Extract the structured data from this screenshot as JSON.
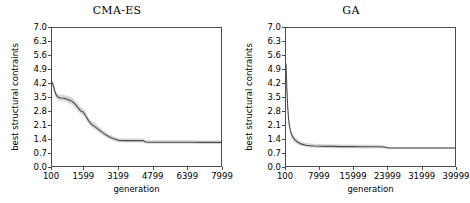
{
  "figure": {
    "width": 468,
    "height": 203,
    "background": "#ffffff",
    "line_color": "#4d4d4d",
    "band_color": "#c8c8c8",
    "axis_color": "#4c4c4c"
  },
  "panels": [
    {
      "id": "cma-es",
      "title": "CMA-ES",
      "xlabel": "generation",
      "ylabel": "best structural contraints"
    },
    {
      "id": "ga",
      "title": "GA",
      "xlabel": "generation",
      "ylabel": "best structural contraints"
    }
  ],
  "chart_data": [
    {
      "type": "line",
      "title": "CMA-ES",
      "xlabel": "generation",
      "ylabel": "best structural contraints",
      "xlim": [
        100,
        7999
      ],
      "ylim": [
        0.0,
        7.0
      ],
      "grid": false,
      "legend": null,
      "xticks": [
        100,
        1599,
        3199,
        4799,
        6399,
        7999
      ],
      "xticklabels": [
        "100",
        "1599",
        "3199",
        "4799",
        "6399",
        "7999"
      ],
      "yticks": [
        0.0,
        0.7,
        1.4,
        2.1,
        2.8,
        3.5,
        4.2,
        4.9,
        5.6,
        6.3,
        7.0
      ],
      "yticklabels": [
        "0.0",
        "0.7",
        "1.4",
        "2.1",
        "2.8",
        "3.5",
        "4.2",
        "4.9",
        "5.6",
        "6.3",
        "7.0"
      ],
      "series": [
        {
          "name": "best structural contraints (mean)",
          "x": [
            100,
            180,
            260,
            340,
            420,
            520,
            620,
            720,
            820,
            940,
            1060,
            1180,
            1300,
            1420,
            1540,
            1660,
            1780,
            1900,
            2020,
            2140,
            2260,
            2380,
            2500,
            2620,
            2740,
            2860,
            2980,
            3100,
            3199,
            3400,
            3700,
            4000,
            4300,
            4420,
            4600,
            5000,
            5500,
            6000,
            6500,
            7000,
            7500,
            7999
          ],
          "values": [
            4.3,
            4.05,
            3.72,
            3.58,
            3.52,
            3.5,
            3.49,
            3.47,
            3.42,
            3.38,
            3.3,
            3.18,
            3.02,
            2.86,
            2.8,
            2.6,
            2.38,
            2.2,
            2.12,
            2.02,
            1.92,
            1.82,
            1.72,
            1.64,
            1.56,
            1.5,
            1.45,
            1.41,
            1.38,
            1.37,
            1.37,
            1.37,
            1.37,
            1.3,
            1.29,
            1.29,
            1.29,
            1.29,
            1.29,
            1.28,
            1.28,
            1.28
          ],
          "band_lower": [
            4.2,
            3.92,
            3.58,
            3.44,
            3.38,
            3.36,
            3.34,
            3.32,
            3.26,
            3.2,
            3.12,
            3.0,
            2.84,
            2.7,
            2.62,
            2.44,
            2.24,
            2.06,
            1.98,
            1.88,
            1.78,
            1.7,
            1.6,
            1.52,
            1.46,
            1.4,
            1.35,
            1.31,
            1.29,
            1.28,
            1.28,
            1.28,
            1.28,
            1.22,
            1.21,
            1.21,
            1.21,
            1.21,
            1.21,
            1.2,
            1.2,
            1.2
          ],
          "band_upper": [
            4.4,
            4.2,
            3.88,
            3.74,
            3.68,
            3.66,
            3.66,
            3.64,
            3.6,
            3.58,
            3.5,
            3.38,
            3.22,
            3.04,
            2.98,
            2.78,
            2.54,
            2.36,
            2.28,
            2.18,
            2.08,
            1.96,
            1.86,
            1.78,
            1.68,
            1.62,
            1.56,
            1.52,
            1.49,
            1.48,
            1.48,
            1.48,
            1.48,
            1.4,
            1.39,
            1.39,
            1.39,
            1.39,
            1.39,
            1.38,
            1.38,
            1.38
          ]
        }
      ]
    },
    {
      "type": "line",
      "title": "GA",
      "xlabel": "generation",
      "ylabel": "best structural contraints",
      "xlim": [
        100,
        39999
      ],
      "ylim": [
        0.0,
        7.0
      ],
      "grid": false,
      "legend": null,
      "xticks": [
        100,
        7999,
        15999,
        23999,
        31999,
        39999
      ],
      "xticklabels": [
        "100",
        "7999",
        "15999",
        "23999",
        "31999",
        "39999"
      ],
      "yticks": [
        0.0,
        0.7,
        1.4,
        2.1,
        2.8,
        3.5,
        4.2,
        4.9,
        5.6,
        6.3,
        7.0
      ],
      "yticklabels": [
        "0.0",
        "0.7",
        "1.4",
        "2.1",
        "2.8",
        "3.5",
        "4.2",
        "4.9",
        "5.6",
        "6.3",
        "7.0"
      ],
      "series": [
        {
          "name": "best structural contraints (mean)",
          "x": [
            100,
            300,
            500,
            700,
            900,
            1200,
            1500,
            1900,
            2300,
            2800,
            3400,
            4000,
            4800,
            5600,
            6600,
            7999,
            9500,
            11000,
            13000,
            15999,
            18000,
            20000,
            21500,
            23000,
            23999,
            26000,
            29000,
            31999,
            35000,
            37500,
            39999
          ],
          "values": [
            5.2,
            3.95,
            3.05,
            2.45,
            2.1,
            1.8,
            1.62,
            1.48,
            1.38,
            1.3,
            1.22,
            1.18,
            1.14,
            1.12,
            1.1,
            1.09,
            1.08,
            1.08,
            1.07,
            1.07,
            1.06,
            1.06,
            1.06,
            1.05,
            1.0,
            1.0,
            1.0,
            1.0,
            1.0,
            1.0,
            1.0
          ],
          "band_lower": [
            5.05,
            3.78,
            2.88,
            2.28,
            1.94,
            1.66,
            1.48,
            1.34,
            1.25,
            1.18,
            1.12,
            1.08,
            1.05,
            1.03,
            1.01,
            1.0,
            0.99,
            0.99,
            0.99,
            0.99,
            0.98,
            0.98,
            0.98,
            0.98,
            0.96,
            0.96,
            0.96,
            0.96,
            0.96,
            0.96,
            0.96
          ],
          "band_upper": [
            5.35,
            4.14,
            3.24,
            2.64,
            2.28,
            1.96,
            1.78,
            1.64,
            1.54,
            1.44,
            1.34,
            1.3,
            1.25,
            1.23,
            1.21,
            1.2,
            1.19,
            1.19,
            1.18,
            1.18,
            1.16,
            1.16,
            1.16,
            1.14,
            1.05,
            1.05,
            1.05,
            1.05,
            1.05,
            1.05,
            1.05
          ]
        }
      ]
    }
  ]
}
